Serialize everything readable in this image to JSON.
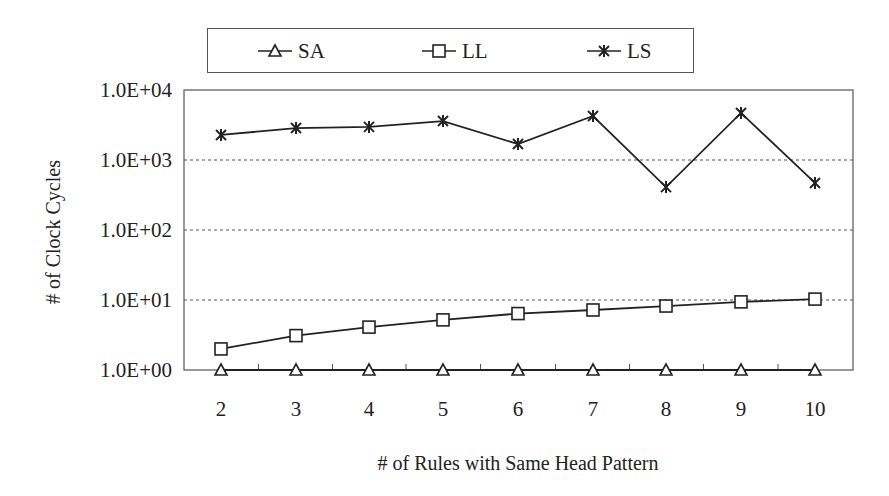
{
  "chart_data": {
    "type": "line",
    "title": "",
    "xlabel": "# of Rules with Same Head Pattern",
    "ylabel": "# of Clock Cycles",
    "yscale": "log",
    "ylim": [
      1,
      10000
    ],
    "yticks": [
      "1.0E+00",
      "1.0E+01",
      "1.0E+02",
      "1.0E+03",
      "1.0E+04"
    ],
    "x": [
      2,
      3,
      4,
      5,
      6,
      7,
      8,
      9,
      10
    ],
    "grid": "horizontal dotted at each decade",
    "legend_position": "top (boxed, horizontal)",
    "series": [
      {
        "name": "SA",
        "marker": "triangle",
        "values": [
          1,
          1,
          1,
          1,
          1,
          1,
          1,
          1,
          1
        ]
      },
      {
        "name": "LL",
        "marker": "square",
        "values": [
          2,
          3.1,
          4.1,
          5.2,
          6.4,
          7.2,
          8.2,
          9.4,
          10.3
        ]
      },
      {
        "name": "LS",
        "marker": "asterisk",
        "values": [
          2280,
          2860,
          2970,
          3600,
          1690,
          4250,
          410,
          4700,
          470
        ]
      }
    ]
  },
  "legend": {
    "items": [
      {
        "label": "SA",
        "marker": "triangle"
      },
      {
        "label": "LL",
        "marker": "square"
      },
      {
        "label": "LS",
        "marker": "asterisk"
      }
    ]
  },
  "axes": {
    "x_title": "# of Rules with Same Head Pattern",
    "y_title": "# of Clock Cycles"
  },
  "colors": {
    "line": "#222222",
    "grid": "#555555",
    "frame": "#555555"
  }
}
